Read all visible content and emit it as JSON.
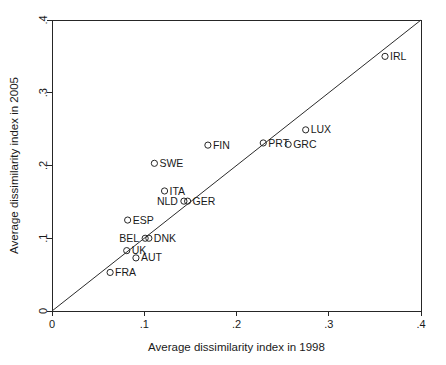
{
  "chart_data": {
    "type": "scatter",
    "title": "",
    "xlabel": "Average dissimilarity index in 1998",
    "ylabel": "Average dissimilarity index in 2005",
    "xlim": [
      0,
      0.4
    ],
    "ylim": [
      0,
      0.4
    ],
    "xticks": [
      "0",
      ".1",
      ".2",
      ".3",
      ".4"
    ],
    "xtick_values": [
      0,
      0.1,
      0.2,
      0.3,
      0.4
    ],
    "yticks": [
      "0",
      ".1",
      ".2",
      ".3",
      ".4"
    ],
    "ytick_values": [
      0,
      0.1,
      0.2,
      0.3,
      0.4
    ],
    "grid": false,
    "legend": "none",
    "marker_style": "open-circle",
    "reference_line": {
      "name": "45-degree-line",
      "description": "y = x diagonal from (0,0) to (.4,.4)",
      "from": [
        0,
        0
      ],
      "to": [
        0.4,
        0.4
      ]
    },
    "points": [
      {
        "label": "IRL",
        "x": 0.361,
        "y": 0.35,
        "label_side": "right"
      },
      {
        "label": "LUX",
        "x": 0.275,
        "y": 0.249,
        "label_side": "right"
      },
      {
        "label": "GRC",
        "x": 0.256,
        "y": 0.229,
        "label_side": "right"
      },
      {
        "label": "PRT",
        "x": 0.229,
        "y": 0.231,
        "label_side": "right"
      },
      {
        "label": "FIN",
        "x": 0.169,
        "y": 0.228,
        "label_side": "right"
      },
      {
        "label": "SWE",
        "x": 0.111,
        "y": 0.203,
        "label_side": "right"
      },
      {
        "label": "ITA",
        "x": 0.122,
        "y": 0.165,
        "label_side": "right"
      },
      {
        "label": "GER",
        "x": 0.147,
        "y": 0.151,
        "label_side": "right"
      },
      {
        "label": "NLD",
        "x": 0.143,
        "y": 0.151,
        "label_side": "left"
      },
      {
        "label": "ESP",
        "x": 0.082,
        "y": 0.125,
        "label_side": "right"
      },
      {
        "label": "DNK",
        "x": 0.105,
        "y": 0.1,
        "label_side": "right"
      },
      {
        "label": "BEL",
        "x": 0.101,
        "y": 0.1,
        "label_side": "left"
      },
      {
        "label": "UK",
        "x": 0.081,
        "y": 0.083,
        "label_side": "right"
      },
      {
        "label": "AUT",
        "x": 0.091,
        "y": 0.073,
        "label_side": "right"
      },
      {
        "label": "FRA",
        "x": 0.063,
        "y": 0.053,
        "label_side": "right"
      }
    ],
    "colors": {
      "marker_stroke": "#262626",
      "axis": "#262626",
      "reference_line": "#2b2b2b",
      "background": "#ffffff",
      "text": "#1a1a1a"
    }
  }
}
